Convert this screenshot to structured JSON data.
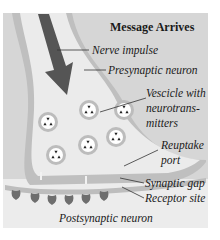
{
  "diagram": {
    "title": "Message Arrives",
    "labels": {
      "nerve_impulse": "Nerve impulse",
      "presynaptic_neuron": "Presynaptic neuron",
      "vescicle_line1": "Vescicle with",
      "vescicle_line2": "neurotrans-",
      "vescicle_line3": "mitters",
      "reuptake_line1": "Reuptake",
      "reuptake_line2": "port",
      "synaptic_gap": "Synaptic gap",
      "receptor_site": "Receptor site",
      "postsynaptic_neuron": "Postsynaptic neuron"
    },
    "vesicle_count": 6,
    "receptor_count": 6,
    "colors": {
      "background": "#d9d9d9",
      "lower_background": "#ececec",
      "neuron_fill": "#e6e6e6",
      "membrane": "#bdbdbd",
      "arrow": "#555555",
      "vesicle_ring": "#bcbcbc",
      "receptor": "#6e6e6e"
    }
  }
}
